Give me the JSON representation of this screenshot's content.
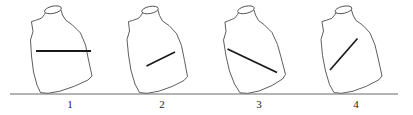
{
  "figure": {
    "name": "water-level-task-bottles",
    "background_color": "#ffffff",
    "outline_color": "#4c4c4c",
    "waterline_color": "#1a1a1a",
    "ground_color": "#6b6b6b",
    "label_color": "#1a1a1a",
    "ground": {
      "label": "ground-line",
      "x1": 10,
      "y1": 94,
      "x2": 398,
      "y2": 94
    },
    "bottles": [
      {
        "id": "bottle-1",
        "caption": "1",
        "caption_x": 70,
        "caption_y": 108,
        "tilt_degrees": 18,
        "tilt_direction": "right",
        "pivot_x": 73,
        "pivot_y": 93,
        "waterline_orientation": "horizontal",
        "waterline": {
          "x1": 36,
          "y1": 51,
          "x2": 91,
          "y2": 51
        },
        "waterline_width": 2.1,
        "body": "M 31.5 22.0 L 33.0 31.5 L 30.5 40.0 L 31.5 56.0 L 33.5 72.0 L 37.0 85.0 L 40.5 92.6 L 48.0 93.3 L 60.0 91.2 L 74.5 86.2 L 88.0 80.0 L 92.0 76.0 L 88.5 60.0 L 85.5 45.0 L 80.5 33.0 L 72.5 25.0 L 66.0 20.5 L 62.5 15.0 L 61.0 10.0 L 53.0 8.7 L 46.5 10.0 L 44.5 14.5 L 41.5 18.2 L 36.0 20.2 Z",
        "mouth": {
          "cx": 53.0,
          "cy": 9.8,
          "rx": 8.6,
          "ry": 3.6,
          "rotate": -12
        },
        "base_point": {
          "x": 44.0,
          "y": 93.0
        }
      },
      {
        "id": "bottle-2",
        "caption": "2",
        "caption_x": 162,
        "caption_y": 108,
        "tilt_degrees": 16,
        "tilt_direction": "right",
        "pivot_x": 163,
        "pivot_y": 93,
        "waterline_orientation": "perpendicular-to-bottle-axis",
        "waterline": {
          "x1": 146.5,
          "y1": 66.0,
          "x2": 175.0,
          "y2": 52.0
        },
        "waterline_width": 1.6,
        "body": "M 128.5 22.0 L 129.5 31.0 L 127.0 39.5 L 128.5 55.0 L 131.0 70.5 L 135.0 84.0 L 139.5 92.6 L 147.0 93.3 L 158.5 91.3 L 172.0 86.5 L 184.0 80.5 L 187.5 76.5 L 184.5 60.5 L 181.5 45.5 L 176.5 33.5 L 169.0 25.5 L 162.5 21.0 L 159.5 15.5 L 158.0 10.2 L 150.0 8.9 L 143.5 10.2 L 141.5 14.8 L 138.5 18.4 L 133.0 20.3 Z",
        "mouth": {
          "cx": 150.0,
          "cy": 10.0,
          "rx": 8.4,
          "ry": 3.5,
          "rotate": -11
        },
        "base_point": {
          "x": 143.0,
          "y": 93.0
        }
      },
      {
        "id": "bottle-3",
        "caption": "3",
        "caption_x": 259,
        "caption_y": 108,
        "tilt_degrees": 20,
        "tilt_direction": "right",
        "pivot_x": 260,
        "pivot_y": 93,
        "waterline_orientation": "steep-diagonal-down-right",
        "waterline": {
          "x1": 227.5,
          "y1": 49.0,
          "x2": 277.0,
          "y2": 72.5
        },
        "waterline_width": 1.9,
        "body": "M 225.0 22.5 L 226.0 31.5 L 223.5 40.0 L 226.0 56.0 L 229.5 71.0 L 234.5 84.0 L 240.0 92.8 L 247.5 93.4 L 259.0 91.0 L 272.0 85.5 L 282.5 79.0 L 285.5 74.5 L 281.5 59.0 L 277.5 44.5 L 272.0 32.5 L 264.5 25.0 L 258.5 20.5 L 255.5 15.0 L 254.0 10.0 L 246.0 8.7 L 239.5 10.0 L 237.5 14.6 L 234.5 18.3 L 229.5 20.4 Z",
        "mouth": {
          "cx": 246.0,
          "cy": 9.8,
          "rx": 8.5,
          "ry": 3.5,
          "rotate": -13
        },
        "base_point": {
          "x": 243.0,
          "y": 93.0
        }
      },
      {
        "id": "bottle-4",
        "caption": "4",
        "caption_x": 356,
        "caption_y": 108,
        "tilt_degrees": 17,
        "tilt_direction": "right",
        "pivot_x": 357,
        "pivot_y": 93,
        "waterline_orientation": "diagonal-down-left",
        "waterline": {
          "x1": 330.0,
          "y1": 70.0,
          "x2": 357.5,
          "y2": 38.5
        },
        "waterline_width": 1.7,
        "body": "M 322.0 22.0 L 323.5 31.0 L 321.0 39.5 L 322.5 55.5 L 325.5 71.0 L 329.5 84.5 L 334.0 92.6 L 341.5 93.3 L 353.0 91.2 L 366.5 86.2 L 378.5 80.0 L 382.0 76.0 L 378.5 60.0 L 375.0 45.0 L 370.0 33.0 L 362.5 25.0 L 356.0 20.5 L 353.0 15.0 L 351.5 10.0 L 343.5 8.7 L 337.0 10.0 L 335.0 14.5 L 332.0 18.2 L 326.5 20.2 Z",
        "mouth": {
          "cx": 343.5,
          "cy": 9.8,
          "rx": 8.5,
          "ry": 3.5,
          "rotate": -12
        },
        "base_point": {
          "x": 337.5,
          "y": 93.0
        }
      }
    ]
  }
}
